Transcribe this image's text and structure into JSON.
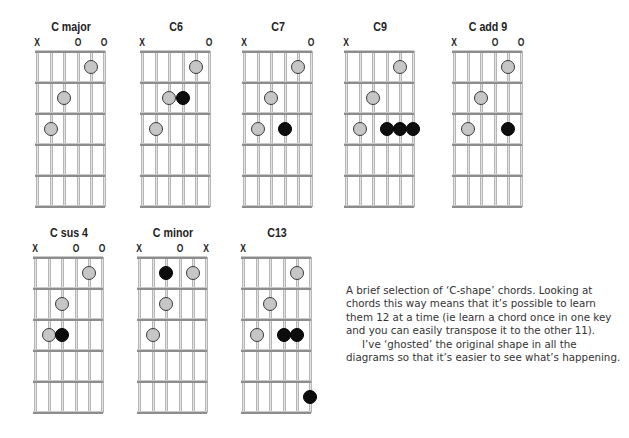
{
  "chords": [
    {
      "name": "C major",
      "pos": {
        "x": 36,
        "y": 19
      },
      "markers": [
        "X",
        "",
        "",
        "O",
        "",
        "O"
      ],
      "ghost_dots": [
        {
          "string": 5,
          "fret": 1
        },
        {
          "string": 3,
          "fret": 2
        },
        {
          "string": 2,
          "fret": 3
        }
      ],
      "black_dots": []
    },
    {
      "name": "C6",
      "pos": {
        "x": 141,
        "y": 19
      },
      "markers": [
        "X",
        "",
        "",
        "",
        "",
        "O"
      ],
      "ghost_dots": [
        {
          "string": 5,
          "fret": 1
        },
        {
          "string": 3,
          "fret": 2
        },
        {
          "string": 2,
          "fret": 3
        }
      ],
      "black_dots": [
        {
          "string": 4,
          "fret": 2
        }
      ]
    },
    {
      "name": "C7",
      "pos": {
        "x": 243,
        "y": 19
      },
      "markers": [
        "X",
        "",
        "",
        "",
        "",
        "O"
      ],
      "ghost_dots": [
        {
          "string": 5,
          "fret": 1
        },
        {
          "string": 3,
          "fret": 2
        },
        {
          "string": 2,
          "fret": 3
        }
      ],
      "black_dots": [
        {
          "string": 4,
          "fret": 3
        }
      ]
    },
    {
      "name": "C9",
      "pos": {
        "x": 345,
        "y": 19
      },
      "markers": [
        "X",
        "",
        "",
        "",
        "",
        ""
      ],
      "ghost_dots": [
        {
          "string": 5,
          "fret": 1
        },
        {
          "string": 3,
          "fret": 2
        },
        {
          "string": 2,
          "fret": 3
        }
      ],
      "black_dots": [
        {
          "string": 4,
          "fret": 3
        },
        {
          "string": 5,
          "fret": 3
        },
        {
          "string": 6,
          "fret": 3
        }
      ]
    },
    {
      "name": "C add 9",
      "pos": {
        "x": 453,
        "y": 19
      },
      "markers": [
        "X",
        "",
        "",
        "O",
        "",
        "O"
      ],
      "ghost_dots": [
        {
          "string": 5,
          "fret": 1
        },
        {
          "string": 3,
          "fret": 2
        },
        {
          "string": 2,
          "fret": 3
        }
      ],
      "black_dots": [
        {
          "string": 5,
          "fret": 3
        }
      ]
    },
    {
      "name": "C sus 4",
      "pos": {
        "x": 34,
        "y": 225
      },
      "markers": [
        "X",
        "",
        "",
        "O",
        "",
        "O"
      ],
      "ghost_dots": [
        {
          "string": 5,
          "fret": 1
        },
        {
          "string": 3,
          "fret": 2
        },
        {
          "string": 2,
          "fret": 3
        }
      ],
      "black_dots": [
        {
          "string": 3,
          "fret": 3
        }
      ]
    },
    {
      "name": "C minor",
      "pos": {
        "x": 138,
        "y": 225
      },
      "markers": [
        "X",
        "",
        "",
        "O",
        "",
        "X"
      ],
      "ghost_dots": [
        {
          "string": 5,
          "fret": 1
        },
        {
          "string": 3,
          "fret": 2
        },
        {
          "string": 2,
          "fret": 3
        }
      ],
      "black_dots": [
        {
          "string": 3,
          "fret": 1
        }
      ]
    },
    {
      "name": "C13",
      "pos": {
        "x": 242,
        "y": 225
      },
      "markers": [
        "X",
        "",
        "",
        "",
        "",
        ""
      ],
      "ghost_dots": [
        {
          "string": 5,
          "fret": 1
        },
        {
          "string": 3,
          "fret": 2
        },
        {
          "string": 2,
          "fret": 3
        }
      ],
      "black_dots": [
        {
          "string": 4,
          "fret": 3
        },
        {
          "string": 5,
          "fret": 3
        },
        {
          "string": 6,
          "fret": 5
        }
      ]
    }
  ],
  "caption": {
    "paragraph1": "A brief selection of ‘C-shape’ chords. Looking at chords this way means that it’s possible to learn them 12 at a time (ie learn a chord once in one key and you can easily transpose it to the other 11).",
    "paragraph2": "I’ve ‘ghosted’ the original shape in all the diagrams so that it’s easier to see what’s happening."
  },
  "colors": {
    "ghost_dot": "#c6c6c6",
    "black_dot": "#0d0d0d",
    "fret_line": "#8d8d8d",
    "string_line": "#e4e4e4",
    "text": "#222222"
  }
}
